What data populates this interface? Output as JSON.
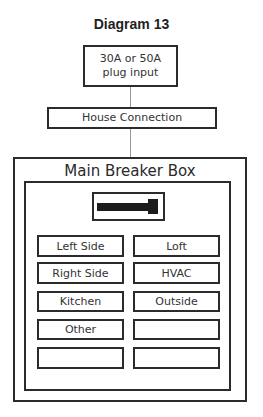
{
  "title": "Diagram 13",
  "nodes": {
    "plug_input": "30A or 50A plug input",
    "house_connection": "House Connection",
    "main_breaker_box": "Main Breaker Box"
  },
  "breakers": {
    "left": [
      "Left Side",
      "Right Side",
      "Kitchen",
      "Other",
      ""
    ],
    "right": [
      "Loft",
      "HVAC",
      "Outside",
      "",
      ""
    ]
  },
  "icons": {
    "main_switch": "main-breaker-switch-icon"
  }
}
